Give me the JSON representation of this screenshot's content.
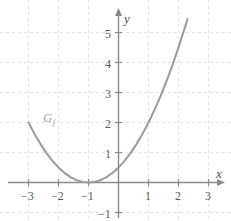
{
  "chart_data": {
    "type": "line",
    "title": "",
    "subtitle": "",
    "xlabel": "x",
    "ylabel": "y",
    "xlim": [
      -3.6,
      3.5
    ],
    "ylim": [
      -1.4,
      5.6
    ],
    "xticks": [
      -3,
      -2,
      -1,
      1,
      2,
      3
    ],
    "yticks": [
      -1,
      1,
      2,
      3,
      4,
      5
    ],
    "xtick_labels": [
      "−3",
      "−2",
      "−1",
      "1",
      "2",
      "3"
    ],
    "ytick_labels": [
      "−1",
      "1",
      "2",
      "3",
      "4",
      "5"
    ],
    "grid": true,
    "grid_style": "dashed",
    "legend": "none",
    "annotations": [
      {
        "text": "G",
        "subscript": "f",
        "x": -2.4,
        "y": 2.05,
        "color": "#a8a8a8"
      }
    ],
    "series": [
      {
        "name": "G_f",
        "equation": "f(x) = 0.5 (x + 1)^2",
        "color": "#9a9a9a",
        "linewidth": 2,
        "x": [
          -3.0,
          -2.8,
          -2.6,
          -2.4,
          -2.2,
          -2.0,
          -1.8,
          -1.6,
          -1.4,
          -1.2,
          -1.0,
          -0.8,
          -0.6,
          -0.4,
          -0.2,
          0.0,
          0.2,
          0.4,
          0.6,
          0.8,
          1.0,
          1.2,
          1.4,
          1.6,
          1.8,
          2.0,
          2.2,
          2.3
        ],
        "values": [
          2.0,
          1.62,
          1.28,
          0.98,
          0.72,
          0.5,
          0.32,
          0.18,
          0.08,
          0.02,
          0.0,
          0.02,
          0.08,
          0.18,
          0.32,
          0.5,
          0.72,
          0.98,
          1.28,
          1.62,
          2.0,
          2.42,
          2.88,
          3.38,
          3.92,
          4.5,
          5.12,
          5.45
        ]
      }
    ]
  },
  "axes": {
    "x_axis_name": "x",
    "y_axis_name": "y"
  },
  "colors": {
    "curve": "#9a9a9a",
    "axis": "#8a8a8a",
    "grid": "#d8dce4",
    "tick_text": "#5a5a5a",
    "label_text": "#a8a8a8",
    "background": "#ffffff"
  }
}
